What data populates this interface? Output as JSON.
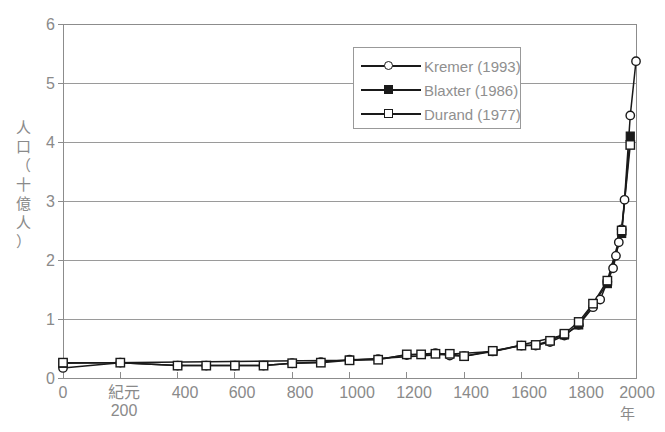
{
  "chart_data": {
    "type": "line",
    "title": "",
    "xlabel": "年",
    "ylabel": "人口（十億人）",
    "xlim": [
      0,
      2000
    ],
    "ylim": [
      0,
      6
    ],
    "grid": "horizontal",
    "legend_position": "top-center-right",
    "y_ticks": [
      "0",
      "1",
      "2",
      "3",
      "4",
      "5",
      "6"
    ],
    "x_ticks": [
      "0",
      "紀元",
      "400",
      "600",
      "800",
      "1000",
      "1200",
      "1400",
      "1600",
      "1800",
      "2000"
    ],
    "x_tick_second_line": "200",
    "x_unit_label": "年",
    "series": [
      {
        "name": "Kremer (1993)",
        "marker": "open-circle",
        "color": "#1a1a1a",
        "points": [
          [
            0,
            0.17
          ],
          [
            200,
            0.26
          ],
          [
            400,
            0.21
          ],
          [
            500,
            0.21
          ],
          [
            600,
            0.21
          ],
          [
            700,
            0.21
          ],
          [
            800,
            0.25
          ],
          [
            900,
            0.27
          ],
          [
            1000,
            0.31
          ],
          [
            1100,
            0.32
          ],
          [
            1200,
            0.39
          ],
          [
            1300,
            0.42
          ],
          [
            1350,
            0.38
          ],
          [
            1400,
            0.37
          ],
          [
            1500,
            0.45
          ],
          [
            1600,
            0.55
          ],
          [
            1650,
            0.55
          ],
          [
            1700,
            0.61
          ],
          [
            1750,
            0.72
          ],
          [
            1800,
            0.9
          ],
          [
            1850,
            1.2
          ],
          [
            1875,
            1.33
          ],
          [
            1900,
            1.63
          ],
          [
            1920,
            1.86
          ],
          [
            1930,
            2.07
          ],
          [
            1940,
            2.3
          ],
          [
            1950,
            2.52
          ],
          [
            1960,
            3.02
          ],
          [
            1980,
            4.45
          ],
          [
            2000,
            5.37
          ]
        ]
      },
      {
        "name": "Blaxter (1986)",
        "marker": "filled-square",
        "color": "#1a1a1a",
        "points": [
          [
            0,
            0.25
          ],
          [
            1000,
            0.3
          ],
          [
            1500,
            0.45
          ],
          [
            1750,
            0.73
          ],
          [
            1800,
            0.9
          ],
          [
            1900,
            1.6
          ],
          [
            1950,
            2.45
          ],
          [
            1980,
            4.1
          ]
        ]
      },
      {
        "name": "Durand (1977)",
        "marker": "open-square",
        "color": "#1a1a1a",
        "points": [
          [
            0,
            0.26
          ],
          [
            200,
            0.26
          ],
          [
            400,
            0.21
          ],
          [
            500,
            0.21
          ],
          [
            600,
            0.21
          ],
          [
            700,
            0.21
          ],
          [
            800,
            0.25
          ],
          [
            900,
            0.26
          ],
          [
            1000,
            0.3
          ],
          [
            1100,
            0.31
          ],
          [
            1200,
            0.4
          ],
          [
            1250,
            0.4
          ],
          [
            1300,
            0.41
          ],
          [
            1350,
            0.41
          ],
          [
            1400,
            0.37
          ],
          [
            1500,
            0.46
          ],
          [
            1600,
            0.55
          ],
          [
            1650,
            0.56
          ],
          [
            1700,
            0.63
          ],
          [
            1750,
            0.75
          ],
          [
            1800,
            0.95
          ],
          [
            1850,
            1.26
          ],
          [
            1900,
            1.65
          ],
          [
            1950,
            2.5
          ],
          [
            1980,
            3.95
          ]
        ]
      }
    ]
  },
  "legend": {
    "items": [
      {
        "label": "Kremer (1993)",
        "marker": "open-circle"
      },
      {
        "label": "Blaxter (1986)",
        "marker": "filled-square"
      },
      {
        "label": "Durand (1977)",
        "marker": "open-square"
      }
    ]
  },
  "axes": {
    "y_title": "人口（十億人）",
    "y_title_chars": [
      "人",
      "口",
      "（",
      "十",
      "億",
      "人",
      "）"
    ],
    "x_unit": "年"
  },
  "colors": {
    "line": "#1a1a1a",
    "grid": "#9a9a9a",
    "frame": "#8c8c8c",
    "text": "#8a8a8a",
    "background": "#ffffff"
  }
}
